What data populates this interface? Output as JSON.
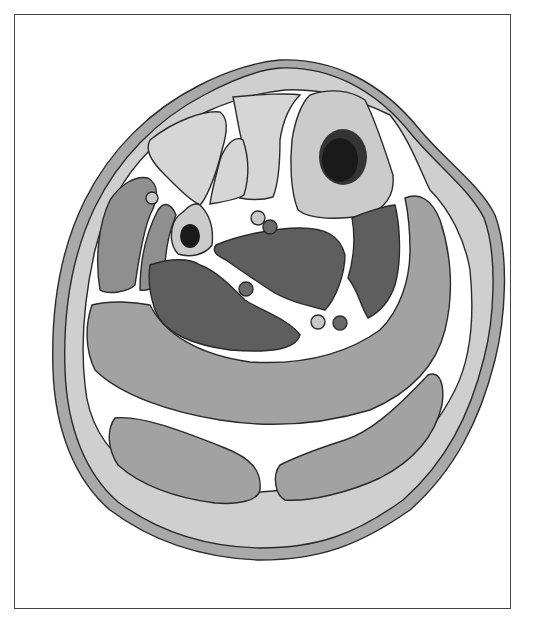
{
  "figure": {
    "labels": []
  },
  "colors": {
    "background": "#ffffff",
    "frame_border": "#444444",
    "skin": "#a9a9a9",
    "subcutaneous": "#cfcfcf",
    "fascia": "#ffffff",
    "outline": "#2a2a2a",
    "light_muscle": "#d6d6d6",
    "medium_muscle": "#8f8f8f",
    "dark_muscle": "#5e5e5e",
    "calf_muscle": "#a2a2a2",
    "bone": "#cbcbcb",
    "marrow": "#1a1a1a",
    "vein": "#c8c8c8",
    "artery": "#6a6a6a"
  },
  "structures": [
    {
      "name": "skin"
    },
    {
      "name": "subcutaneous-tissue"
    },
    {
      "name": "anterior-compartment-muscles",
      "count": 2
    },
    {
      "name": "tibia"
    },
    {
      "name": "fibula"
    },
    {
      "name": "lateral-compartment-muscles",
      "count": 2
    },
    {
      "name": "deep-posterior-muscles",
      "count": 3
    },
    {
      "name": "soleus"
    },
    {
      "name": "gastrocnemius-heads",
      "count": 2
    },
    {
      "name": "neurovascular-bundles",
      "count": 4
    }
  ]
}
